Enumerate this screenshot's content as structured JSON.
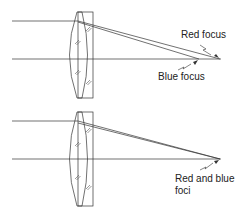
{
  "diagram": {
    "top": {
      "labels": {
        "red": "Red focus",
        "blue": "Blue focus"
      }
    },
    "bottom": {
      "labels": {
        "line1": "Red and blue",
        "line2": "foci"
      }
    },
    "colors": {
      "stroke": "#333333",
      "background": "#ffffff"
    }
  }
}
